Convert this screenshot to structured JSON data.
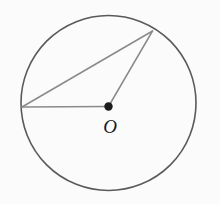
{
  "figure": {
    "type": "geometry-diagram",
    "background_color": "#fbfbfb",
    "canvas": {
      "width": 220,
      "height": 204
    },
    "labels": {
      "center": "O"
    },
    "colors": {
      "circle_stroke": "#5a5a5a",
      "chord_stroke": "#8a8a8a",
      "radius_stroke": "#8a8a8a",
      "center_dot": "#1c1c1c",
      "label_color": "#1c1c1c"
    },
    "circle": {
      "center_x": 108.5,
      "center_y": 103,
      "radius": 87.5,
      "stroke_width": 1.6
    },
    "center_point": {
      "name": "O",
      "x": 108.5,
      "y": 106.5,
      "dot_radius": 4.2,
      "label_x": 110,
      "label_y": 126
    },
    "points": [
      {
        "name": "A",
        "x": 22,
        "y": 107,
        "on_circle": true
      },
      {
        "name": "B",
        "x": 152.5,
        "y": 31,
        "on_circle": true
      }
    ],
    "segments": [
      {
        "name": "radius-OA",
        "kind": "radius",
        "x1": 22,
        "y1": 107,
        "x2": 108.5,
        "y2": 106.5,
        "stroke_width": 1.5
      },
      {
        "name": "radius-OB",
        "kind": "radius",
        "x1": 108.5,
        "y1": 106.5,
        "x2": 152.5,
        "y2": 31,
        "stroke_width": 1.5
      },
      {
        "name": "chord-AB",
        "kind": "chord",
        "x1": 22,
        "y1": 107,
        "x2": 152.5,
        "y2": 31,
        "stroke_width": 1.5
      }
    ]
  }
}
